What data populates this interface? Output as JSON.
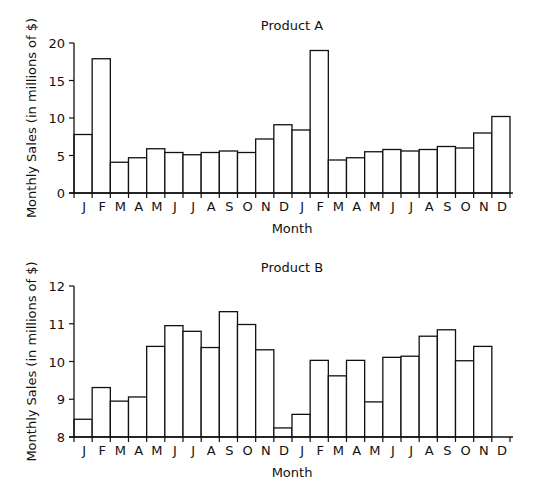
{
  "chart_data": [
    {
      "type": "bar",
      "title": "Product A",
      "xlabel": "Month",
      "ylabel": "Monthly Sales (in millions of $)",
      "ylim": [
        0,
        20
      ],
      "yticks": [
        0,
        5,
        10,
        15,
        20
      ],
      "grid": false,
      "legend": null,
      "categories": [
        "J",
        "F",
        "M",
        "A",
        "M",
        "J",
        "J",
        "A",
        "S",
        "O",
        "N",
        "D",
        "J",
        "F",
        "M",
        "A",
        "M",
        "J",
        "J",
        "A",
        "S",
        "O",
        "N",
        "D"
      ],
      "values": [
        7.8,
        17.9,
        4.1,
        4.7,
        5.9,
        5.4,
        5.1,
        5.4,
        5.6,
        5.4,
        7.2,
        9.1,
        8.4,
        19.0,
        4.4,
        4.7,
        5.5,
        5.8,
        5.6,
        5.8,
        6.2,
        6.0,
        8.0,
        10.2
      ]
    },
    {
      "type": "bar",
      "title": "Product B",
      "xlabel": "Month",
      "ylabel": "Monthly Sales (in millions of $)",
      "ylim": [
        8,
        12
      ],
      "yticks": [
        8,
        9,
        10,
        11,
        12
      ],
      "grid": false,
      "legend": null,
      "categories": [
        "J",
        "F",
        "M",
        "A",
        "M",
        "J",
        "J",
        "A",
        "S",
        "O",
        "N",
        "D",
        "J",
        "F",
        "M",
        "A",
        "M",
        "J",
        "J",
        "A",
        "S",
        "O",
        "N",
        "D"
      ],
      "values": [
        8.47,
        9.31,
        8.95,
        9.06,
        10.4,
        10.95,
        10.8,
        10.37,
        11.32,
        10.98,
        10.31,
        8.24,
        8.6,
        10.03,
        9.62,
        10.03,
        8.93,
        10.11,
        10.14,
        10.67,
        10.84,
        10.02,
        10.4,
        8.0
      ]
    }
  ]
}
